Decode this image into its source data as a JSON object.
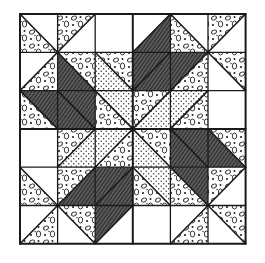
{
  "figure": {
    "kind": "quilt-block-illustration",
    "grid": {
      "rows": 6,
      "cols": 6,
      "left": 20,
      "top": 14,
      "cell_w": 37.6,
      "cell_h": 38.3
    },
    "colors": {
      "line": "#1a1a1a",
      "white": "#ffffff",
      "dark_fill": "#4a4a4a",
      "dot_fill": "#ffffff"
    },
    "fabrics": {
      "W": "white (plain)",
      "D": "dark cross-hatched",
      "P": "pebble / ovals print",
      "S": "fine dots print"
    },
    "cells": [
      [
        {
          "d": "\\",
          "a": "W",
          "b": "P"
        },
        {
          "d": "/",
          "a": "P",
          "b": "W"
        },
        {
          "d": "none",
          "a": "W",
          "b": "W"
        },
        {
          "d": "/",
          "a": "W",
          "b": "D"
        },
        {
          "d": "\\",
          "a": "W",
          "b": "P"
        },
        {
          "d": "/",
          "a": "P",
          "b": "W"
        }
      ],
      [
        {
          "d": "/",
          "a": "W",
          "b": "P"
        },
        {
          "d": "\\",
          "a": "P",
          "b": "D"
        },
        {
          "d": "\\",
          "a": "P",
          "b": "S"
        },
        {
          "d": "/",
          "a": "D",
          "b": "D"
        },
        {
          "d": "/",
          "a": "D",
          "b": "P"
        },
        {
          "d": "\\",
          "a": "P",
          "b": "W"
        }
      ],
      [
        {
          "d": "\\",
          "a": "D",
          "b": "P"
        },
        {
          "d": "\\",
          "a": "D",
          "b": "D"
        },
        {
          "d": "\\",
          "a": "S",
          "b": "P"
        },
        {
          "d": "/",
          "a": "P",
          "b": "S"
        },
        {
          "d": "/",
          "a": "S",
          "b": "P"
        },
        {
          "d": "none",
          "a": "W",
          "b": "W"
        }
      ],
      [
        {
          "d": "none",
          "a": "W",
          "b": "W"
        },
        {
          "d": "/",
          "a": "P",
          "b": "S"
        },
        {
          "d": "/",
          "a": "S",
          "b": "P"
        },
        {
          "d": "\\",
          "a": "P",
          "b": "S"
        },
        {
          "d": "\\",
          "a": "D",
          "b": "D"
        },
        {
          "d": "\\",
          "a": "P",
          "b": "D"
        }
      ],
      [
        {
          "d": "\\",
          "a": "W",
          "b": "P"
        },
        {
          "d": "/",
          "a": "P",
          "b": "D"
        },
        {
          "d": "/",
          "a": "D",
          "b": "D"
        },
        {
          "d": "\\",
          "a": "S",
          "b": "P"
        },
        {
          "d": "\\",
          "a": "D",
          "b": "P"
        },
        {
          "d": "/",
          "a": "P",
          "b": "W"
        }
      ],
      [
        {
          "d": "/",
          "a": "W",
          "b": "P"
        },
        {
          "d": "\\",
          "a": "P",
          "b": "W"
        },
        {
          "d": "/",
          "a": "D",
          "b": "W"
        },
        {
          "d": "none",
          "a": "W",
          "b": "W"
        },
        {
          "d": "/",
          "a": "W",
          "b": "P"
        },
        {
          "d": "\\",
          "a": "P",
          "b": "W"
        }
      ]
    ],
    "cells_legend": "d='\\\\' splits cell top-left→bottom-right: a=upper-right, b=lower-left; d='/' splits top-right→bottom-left: a=upper-left, b=lower-right"
  }
}
